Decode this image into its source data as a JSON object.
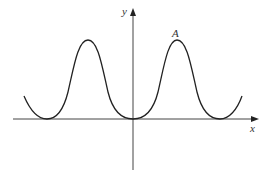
{
  "diagram": {
    "type": "function-graph",
    "axes": {
      "x_label": "x",
      "y_label": "y"
    },
    "point_labels": [
      {
        "label": "A",
        "description": "local maximum right of y-axis"
      }
    ],
    "curve": "periodic wave touching x-axis at origin, two peaks symmetric about y-axis",
    "colors": {
      "stroke": "#222222",
      "background": "#ffffff"
    }
  }
}
